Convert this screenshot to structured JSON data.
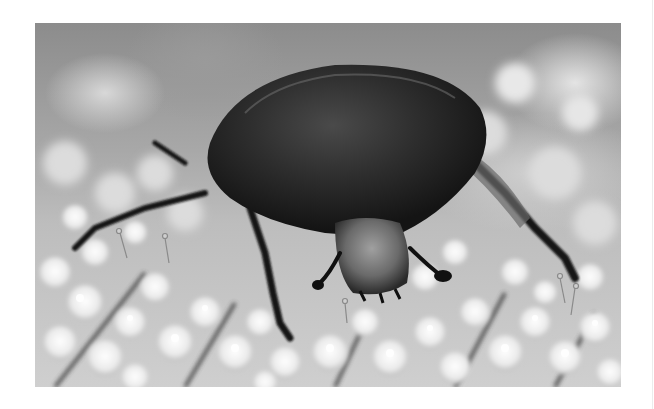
{
  "image": {
    "alt": "Grayscale close-up photograph of a dark beetle crawling on clusters of white flowers",
    "subject": "beetle",
    "background": "white flower clusters",
    "colors": {
      "page": "#ffffff",
      "beetle_shell": "#2a2a2a",
      "flowers": "#f2f2f2",
      "stems": "#3c3c3c"
    }
  }
}
